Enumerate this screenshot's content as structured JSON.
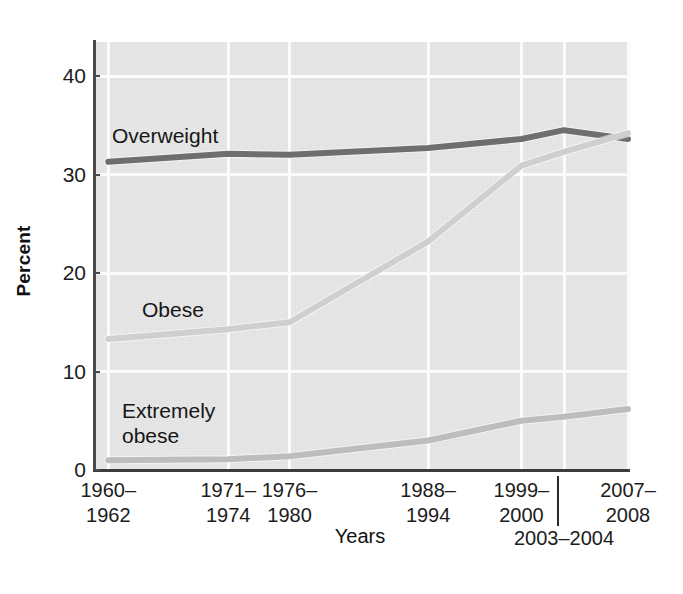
{
  "chart_data": {
    "type": "line",
    "title": "",
    "xlabel": "Years",
    "ylabel": "Percent",
    "ylim": [
      0,
      44
    ],
    "yticks": [
      0,
      10,
      20,
      30,
      40
    ],
    "ytick_labels": [
      "0",
      "10",
      "20",
      "30",
      "40"
    ],
    "grid": true,
    "legend_position": "inline-labels",
    "categories": [
      "1960–1962",
      "1971–1974",
      "1976–1980",
      "1988–1994",
      "1999–2000",
      "2003–2004",
      "2007–2008"
    ],
    "x_positions_pct": [
      2.5,
      25.0,
      36.5,
      62.5,
      80.0,
      88.0,
      100.0
    ],
    "series": [
      {
        "name": "Overweight",
        "color": "#6e6e6e",
        "values": [
          31.3,
          32.1,
          32.0,
          32.7,
          33.6,
          34.5,
          33.6
        ],
        "label_x": 112,
        "label_y": 123
      },
      {
        "name": "Obese",
        "color": "#cfcfcf",
        "values": [
          13.3,
          14.3,
          15.0,
          23.2,
          30.9,
          32.3,
          34.2
        ],
        "label_x": 142,
        "label_y": 297
      },
      {
        "name": "Extremely\nobese",
        "color": "#bdbdbd",
        "values": [
          1.0,
          1.1,
          1.4,
          3.0,
          5.0,
          5.4,
          6.2
        ],
        "label_x": 122,
        "label_y": 398
      }
    ],
    "x_tick_rows": [
      {
        "line1": "1960–",
        "line2": "1962",
        "row": "top"
      },
      {
        "line1": "1971–",
        "line2": "1974",
        "row": "top"
      },
      {
        "line1": "1976–",
        "line2": "1980",
        "row": "top"
      },
      {
        "line1": "1988–",
        "line2": "1994",
        "row": "top"
      },
      {
        "line1": "1999–",
        "line2": "2000",
        "row": "top"
      },
      {
        "line1": "2003–",
        "line2": "2004",
        "row": "bottom"
      },
      {
        "line1": "2007–",
        "line2": "2008",
        "row": "top"
      }
    ],
    "colors": {
      "plot_background": "#e6e6e6",
      "gridline": "#fbfbfb",
      "axis": "#3b3b3b",
      "text": "#1c1c1c"
    },
    "geometry": {
      "plot_left": 95,
      "plot_top": 42,
      "plot_width": 533,
      "plot_height": 428,
      "y_zero_px": 470,
      "px_per_unit": 9.85
    }
  }
}
